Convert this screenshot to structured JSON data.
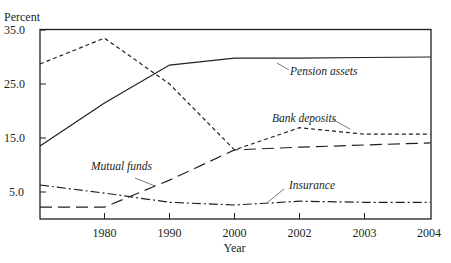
{
  "chart_data": {
    "type": "line",
    "title": "",
    "xlabel": "Year",
    "ylabel": "Percent",
    "x": [
      "1970",
      "1980",
      "1990",
      "2000",
      "2002",
      "2003",
      "2004"
    ],
    "x_tick_labels": [
      "1980",
      "1990",
      "2000",
      "2002",
      "2003",
      "2004"
    ],
    "y_tick_labels": [
      "35.0",
      "25.0",
      "15.0",
      "5.0"
    ],
    "y_ticks": [
      35,
      25,
      15,
      5
    ],
    "ylim": [
      0,
      35
    ],
    "grid": false,
    "legend_position": "inline labels",
    "series": [
      {
        "name": "Pension assets",
        "style": "solid",
        "values": [
          13.5,
          21.5,
          28.5,
          29.8,
          29.8,
          29.9,
          30.0
        ]
      },
      {
        "name": "Bank deposits",
        "style": "dotted",
        "values": [
          28.7,
          33.5,
          25.0,
          12.8,
          16.9,
          15.7,
          15.7
        ]
      },
      {
        "name": "Mutual funds",
        "style": "dashed",
        "values": [
          2.2,
          2.2,
          7.2,
          12.8,
          13.3,
          13.7,
          14.1
        ]
      },
      {
        "name": "Insurance",
        "style": "dash-dot",
        "values": [
          6.3,
          4.8,
          3.1,
          2.6,
          3.3,
          3.1,
          3.1
        ]
      }
    ]
  },
  "labels": {
    "ylabel": "Percent",
    "xlabel": "Year",
    "pension": "Pension assets",
    "bank": "Bank deposits",
    "mutual": "Mutual funds",
    "insurance": "Insurance",
    "y35": "35.0",
    "y25": "25.0",
    "y15": "15.0",
    "y5": "5.0",
    "x1980": "1980",
    "x1990": "1990",
    "x2000": "2000",
    "x2002": "2002",
    "x2003": "2003",
    "x2004": "2004"
  }
}
